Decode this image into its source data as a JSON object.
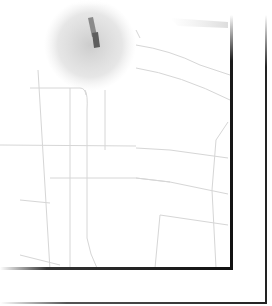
{
  "map": {
    "type": "faded street map fragment",
    "colors": {
      "background": "#ffffff",
      "road": "#d8d8d8",
      "highlight_blob": "#c8c8c8",
      "marker": "#6a6a6a",
      "frame": "#111111"
    },
    "marker": {
      "icon": "location-marker-icon",
      "x": 95,
      "y": 30
    },
    "highlight_area": {
      "cx": 88,
      "cy": 45,
      "r": 45
    }
  }
}
